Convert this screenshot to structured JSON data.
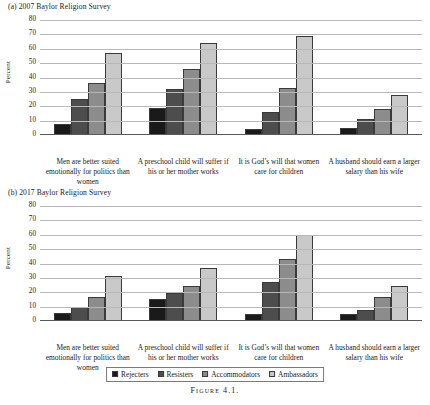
{
  "figure": {
    "caption": "Figure 4.1.",
    "axis_title": "Percent"
  },
  "legend": {
    "position": "bottom-center",
    "entries": [
      {
        "label": "Rejecters",
        "color": "#1a1a1a"
      },
      {
        "label": "Resisters",
        "color": "#4d4d4d"
      },
      {
        "label": "Accommodators",
        "color": "#8c8c8c"
      },
      {
        "label": "Ambassadors",
        "color": "#c9c9c9"
      }
    ]
  },
  "panels": [
    {
      "key": "a",
      "title": "(a) 2007 Baylor Religion Survey"
    },
    {
      "key": "b",
      "title": "(b) 2017 Baylor Religion Survey"
    }
  ],
  "yticks": [
    "80",
    "70",
    "60",
    "50",
    "40",
    "30",
    "20",
    "10",
    "0"
  ],
  "categories": [
    "Men are better suited emotionally for politics than women",
    "A preschool child will suffer if his or her mother works",
    "It is God’s will that women care for children",
    "A husband should earn a larger salary than his wife"
  ],
  "chart_data": [
    {
      "type": "bar",
      "title": "(a) 2007 Baylor Religion Survey",
      "xlabel": "",
      "ylabel": "Percent",
      "ylim": [
        0,
        80
      ],
      "ytick_step": 10,
      "grid": true,
      "legend": "bottom-center",
      "categories": [
        "Men are better suited emotionally for politics than women",
        "A preschool child will suffer if his or her mother works",
        "It is God's will that women care for children",
        "A husband should earn a larger salary than his wife"
      ],
      "series": [
        {
          "name": "Rejecters",
          "color": "#1a1a1a",
          "values": [
            8,
            19,
            4,
            5
          ]
        },
        {
          "name": "Resisters",
          "color": "#4d4d4d",
          "values": [
            25,
            32,
            16,
            11
          ]
        },
        {
          "name": "Accommodators",
          "color": "#8c8c8c",
          "values": [
            36,
            46,
            33,
            18
          ]
        },
        {
          "name": "Ambassadors",
          "color": "#c9c9c9",
          "values": [
            57,
            64,
            69,
            28
          ]
        }
      ]
    },
    {
      "type": "bar",
      "title": "(b) 2017 Baylor Religion Survey",
      "xlabel": "",
      "ylabel": "Percent",
      "ylim": [
        0,
        80
      ],
      "ytick_step": 10,
      "grid": true,
      "legend": "bottom-center",
      "categories": [
        "Men are better suited emotionally for politics than women",
        "A preschool child will suffer if his or her mother works",
        "It is God's will that women care for children",
        "A husband should earn a larger salary than his wife"
      ],
      "series": [
        {
          "name": "Rejecters",
          "color": "#1a1a1a",
          "values": [
            5.5,
            15,
            5,
            5
          ]
        },
        {
          "name": "Resisters",
          "color": "#4d4d4d",
          "values": [
            10,
            19.5,
            27,
            7.5
          ]
        },
        {
          "name": "Accommodators",
          "color": "#8c8c8c",
          "values": [
            16.5,
            24.5,
            43,
            17
          ]
        },
        {
          "name": "Ambassadors",
          "color": "#c9c9c9",
          "values": [
            31,
            37,
            60,
            24.5
          ]
        }
      ]
    }
  ]
}
